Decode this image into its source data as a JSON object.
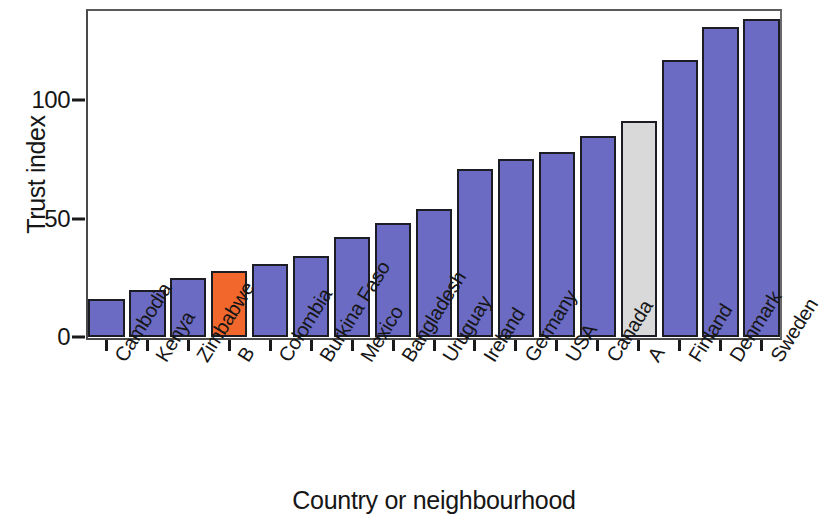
{
  "chart_data": {
    "type": "bar",
    "title": "",
    "xlabel": "Country or neighbourhood",
    "ylabel": "Trust index",
    "categories": [
      "Cambodia",
      "Kenya",
      "Zimbabwe",
      "B",
      "Colombia",
      "Burkina Faso",
      "Mexico",
      "Bangladesh",
      "Uruguay",
      "Ireland",
      "Germany",
      "USA",
      "Canada",
      "A",
      "Finland",
      "Denmark",
      "Sweden"
    ],
    "values": [
      16,
      20,
      25,
      28,
      31,
      34,
      42,
      48,
      54,
      71,
      75,
      78,
      85,
      91,
      117,
      131,
      134
    ],
    "bar_colors": [
      "#6b6bc3",
      "#6b6bc3",
      "#6b6bc3",
      "#f2682c",
      "#6b6bc3",
      "#6b6bc3",
      "#6b6bc3",
      "#6b6bc3",
      "#6b6bc3",
      "#6b6bc3",
      "#6b6bc3",
      "#6b6bc3",
      "#6b6bc3",
      "#d9d9d9",
      "#6b6bc3",
      "#6b6bc3",
      "#6b6bc3"
    ],
    "ytick_labels": [
      "0",
      "50",
      "100"
    ],
    "ytick_values": [
      0,
      50,
      100
    ],
    "ylim": [
      0,
      140
    ],
    "grid": false,
    "legend": "none",
    "colors": {
      "default_bar": "#6b6bc3",
      "highlight_bar": "#f2682c",
      "neutral_bar": "#d9d9d9",
      "bar_outline": "#1c1c24",
      "axis": "#1a1a1a",
      "background": "#ffffff"
    }
  }
}
